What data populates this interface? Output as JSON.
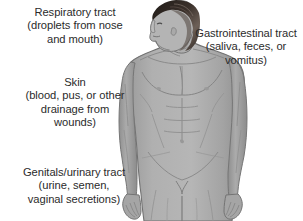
{
  "diagram": {
    "figure": {
      "description": "Grayscale illustration of a nude adult male figure shown from the front, head turned in left profile, cropped at mid-thigh",
      "skin_color": "#a6a6a6",
      "skin_shadow_color": "#8d8d8d",
      "skin_highlight_color": "#bdbdbd",
      "outline_color": "#6f6f6f",
      "hair_color": "#2a231f",
      "hair_highlight_color": "#6b5d52",
      "background_color": "#ffffff"
    },
    "text_color": "#2b2b2b",
    "callouts": [
      {
        "id": "respiratory",
        "label": "Respiratory tract",
        "detail": "(droplets from nose\nand mouth)",
        "full_text": "Respiratory tract\n(droplets from nose\nand mouth)",
        "position": "top-left"
      },
      {
        "id": "gastrointestinal",
        "label": "Gastrointestinal tract",
        "detail": "(saliva, feces, or\nvomitus)",
        "full_text": "Gastrointestinal tract\n(saliva, feces, or\nvomitus)",
        "position": "top-right"
      },
      {
        "id": "skin",
        "label": "Skin",
        "detail": "(blood, pus, or other\ndrainage from\nwounds)",
        "full_text": "Skin\n(blood, pus, or other\ndrainage from\nwounds)",
        "position": "middle-left"
      },
      {
        "id": "genitals",
        "label": "Genitals/urinary tract",
        "detail": "(urine, semen,\nvaginal secretions)",
        "full_text": "Genitals/urinary tract\n(urine, semen,\nvaginal secretions)",
        "position": "bottom-left"
      }
    ]
  }
}
